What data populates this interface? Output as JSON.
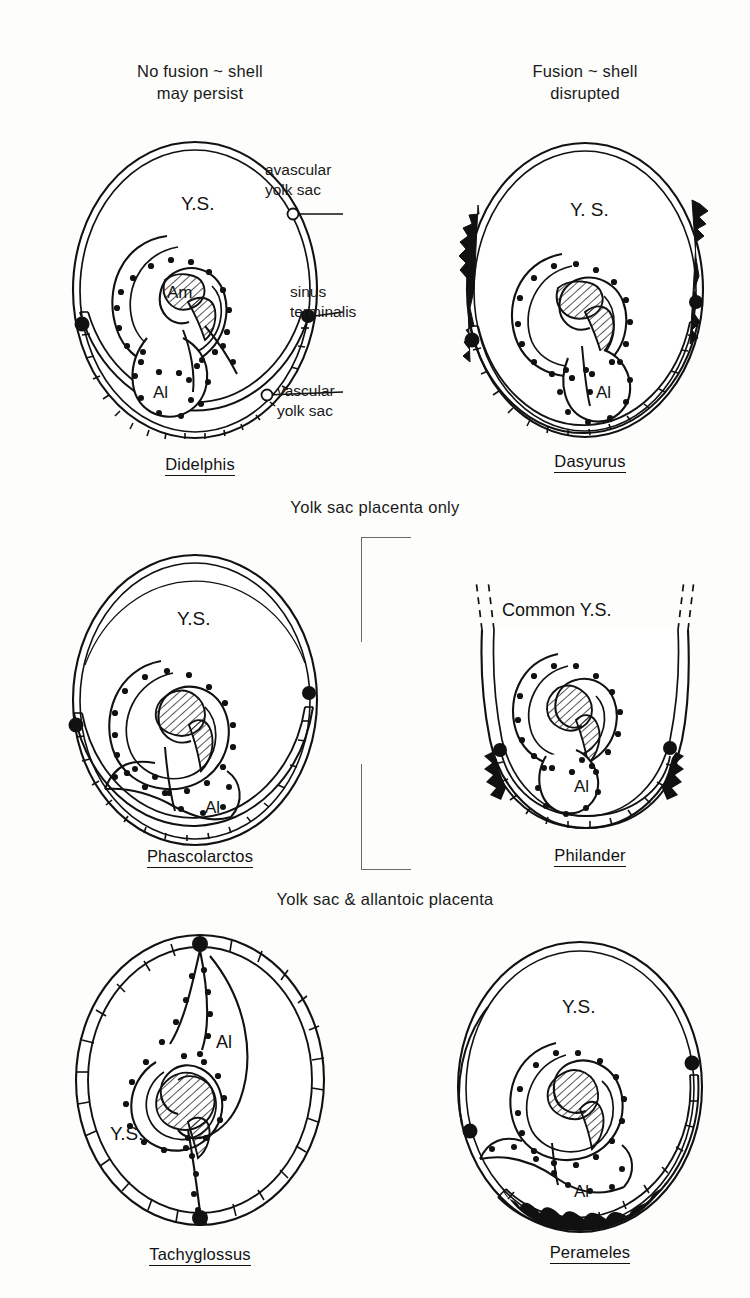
{
  "figure": {
    "domain_note": "comparative fetal membrane / placentation diagram",
    "column_headers": {
      "left": "No fusion ~ shell\nmay persist",
      "right": "Fusion ~ shell\ndisrupted"
    },
    "section_labels": {
      "middle": "Yolk sac placenta only",
      "bottom": "Yolk sac & allantoic placenta"
    },
    "callouts": [
      {
        "key": "avascular",
        "text": "avascular\nyolk sac"
      },
      {
        "key": "sinus",
        "text": "sinus\nterminalis"
      },
      {
        "key": "vascular",
        "text": "vascular\nyolk sac"
      }
    ],
    "structure_labels": {
      "yolk_sac": "Y.S.",
      "common_yolk_sac": "Common Y.S.",
      "amnion": "Am",
      "allantois": "Al"
    },
    "colors": {
      "ink": "#111111",
      "hatch": "#2b2b2b",
      "shell_black": "#111111",
      "paper": "#fdfdfc"
    },
    "panels": [
      {
        "id": "didelphis",
        "species": "Didelphis",
        "row": 1,
        "column": "left",
        "labels": [
          "Y.S.",
          "Am",
          "Al"
        ],
        "has_sinus_terminalis_dots": true,
        "shell_disrupted": false
      },
      {
        "id": "dasyurus",
        "species": "Dasyurus",
        "row": 1,
        "column": "right",
        "labels": [
          "Y.S.",
          "Al"
        ],
        "has_sinus_terminalis_dots": true,
        "shell_disrupted": true
      },
      {
        "id": "phascolarctos",
        "species": "Phascolarctos",
        "row": 2,
        "column": "left",
        "labels": [
          "Y.S.",
          "Al"
        ],
        "has_sinus_terminalis_dots": true,
        "shell_disrupted": false
      },
      {
        "id": "philander",
        "species": "Philander",
        "row": 2,
        "column": "right",
        "labels": [
          "Common Y.S.",
          "Al"
        ],
        "has_sinus_terminalis_dots": true,
        "shell_disrupted": true
      },
      {
        "id": "tachyglossus",
        "species": "Tachyglossus",
        "row": 3,
        "column": "left",
        "labels": [
          "Y.S.",
          "Al"
        ],
        "has_sinus_terminalis_dots": true,
        "shell_disrupted": false
      },
      {
        "id": "perameles",
        "species": "Perameles",
        "row": 3,
        "column": "right",
        "labels": [
          "Y.S.",
          "Al"
        ],
        "has_sinus_terminalis_dots": true,
        "shell_disrupted": true
      }
    ]
  }
}
